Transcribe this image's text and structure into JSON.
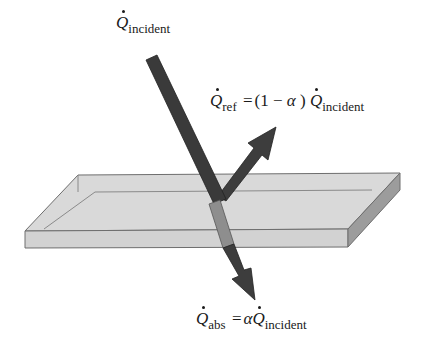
{
  "labels": {
    "incident": {
      "symbol": "Q",
      "subscript": "incident"
    },
    "reflected": {
      "symbol": "Q",
      "subscript": "ref",
      "equals": "=",
      "paren_open": "(1 −",
      "alpha": "α",
      "paren_close": ")",
      "rhs_symbol": "Q",
      "rhs_subscript": "incident"
    },
    "absorbed": {
      "symbol": "Q",
      "subscript": "abs",
      "equals": "=",
      "alpha": "α",
      "rhs_symbol": "Q",
      "rhs_subscript": "incident"
    }
  },
  "colors": {
    "arrow": "#3c3c3c",
    "arrow_inside": "#8a8a8a",
    "slab_top": "#d8d8d8",
    "slab_front": "#cfcfcf",
    "slab_side": "#9a9a9a",
    "slab_edge": "#707070"
  }
}
